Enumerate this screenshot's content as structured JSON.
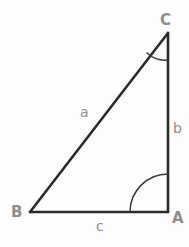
{
  "figure": {
    "kind": "right-triangle-diagram",
    "background_color": "#fdfdfd",
    "line_color": "#2b2b2b",
    "arc_color": "#3a3a3a",
    "label_color": "#8e8e8e",
    "vertices": {
      "A": {
        "label": "A",
        "x": 168,
        "y": 212
      },
      "B": {
        "label": "B",
        "x": 30,
        "y": 212
      },
      "C": {
        "label": "C",
        "x": 168,
        "y": 33
      }
    },
    "sides": {
      "a": {
        "label": "a",
        "from": "B",
        "to": "C"
      },
      "b": {
        "label": "b",
        "from": "C",
        "to": "A"
      },
      "c": {
        "label": "c",
        "from": "B",
        "to": "A"
      }
    },
    "angles": {
      "A": {
        "vertex": "A",
        "arc_radius": 38,
        "marked": true
      },
      "C": {
        "vertex": "C",
        "arc_radius": 27,
        "marked": true
      },
      "B": {
        "vertex": "B",
        "arc_radius": 0,
        "marked": false
      }
    },
    "paths": {
      "side_a": "M 30 212 L 168 33",
      "side_b": "M 168 33 L 168 212",
      "side_c": "M 30 212 L 168 212",
      "arc_A": "M 130 212 A 38 38 0 0 1 168 174",
      "arc_C": "M 168 60 A 27 27 0 0 1 147 53"
    }
  }
}
